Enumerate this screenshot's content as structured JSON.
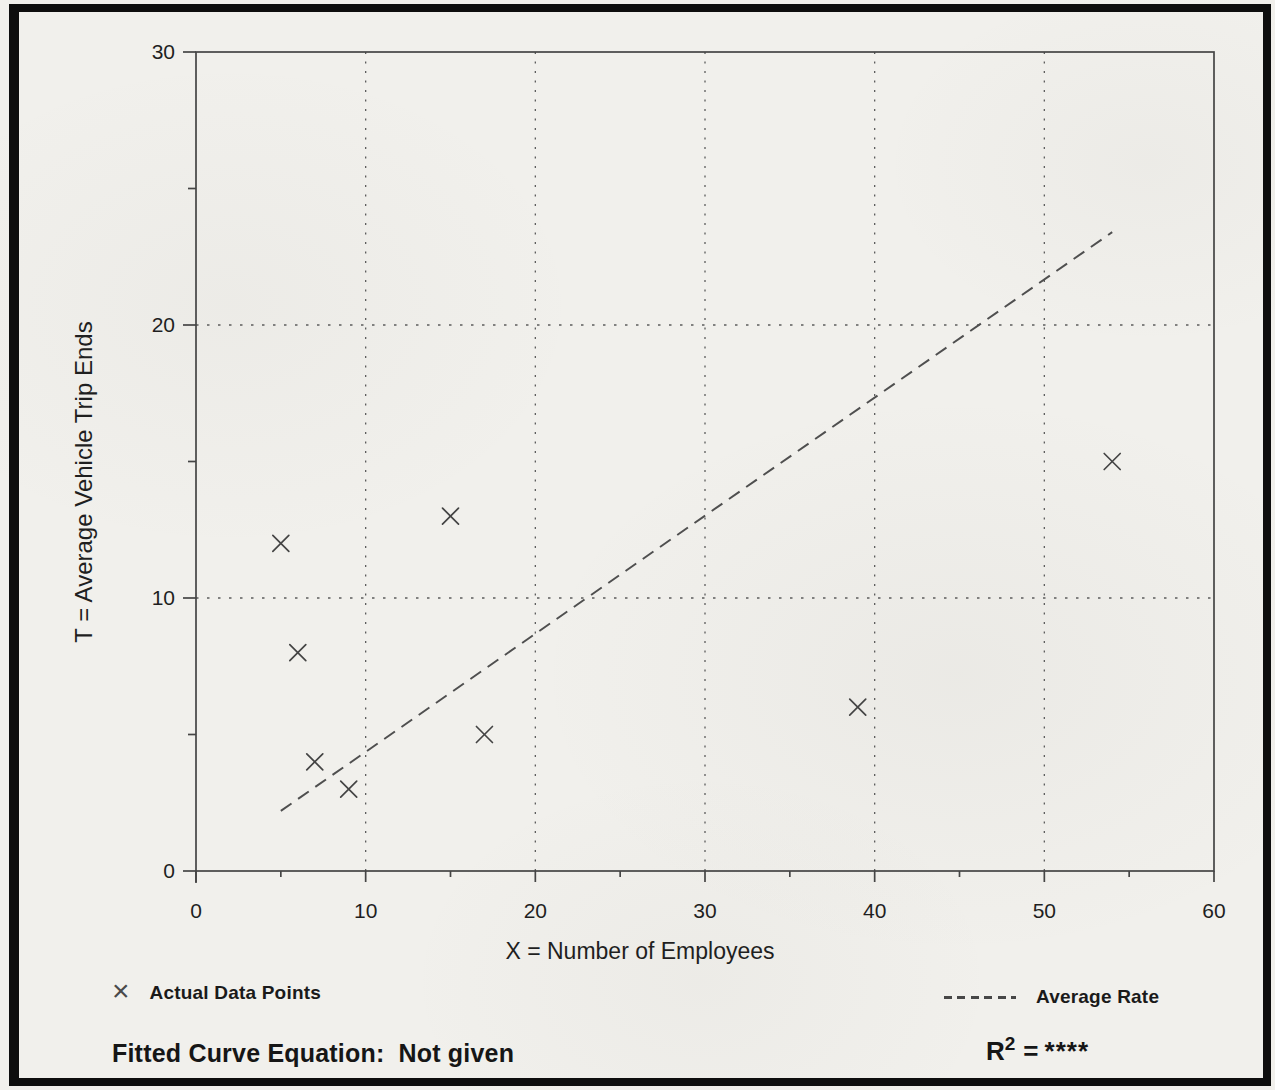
{
  "chart_data": {
    "type": "scatter",
    "title": "",
    "xlabel": "X = Number of Employees",
    "ylabel": "T = Average Vehicle Trip Ends",
    "xlim": [
      0,
      60
    ],
    "ylim": [
      0,
      30
    ],
    "x_major_ticks": [
      0,
      10,
      20,
      30,
      40,
      50,
      60
    ],
    "x_minor_ticks": [
      5,
      15,
      25,
      35,
      45,
      55
    ],
    "y_major_ticks": [
      0,
      10,
      20,
      30
    ],
    "y_minor_ticks": [
      5,
      15,
      25
    ],
    "grid": {
      "show": true,
      "style": "dotted",
      "x_lines": [
        10,
        20,
        30,
        40,
        50
      ],
      "y_lines": [
        10,
        20
      ]
    },
    "legend_position": "below",
    "series": [
      {
        "name": "Actual Data Points",
        "type": "scatter",
        "marker": "x",
        "points": [
          {
            "x": 5,
            "y": 12
          },
          {
            "x": 6,
            "y": 8
          },
          {
            "x": 7,
            "y": 4
          },
          {
            "x": 9,
            "y": 3
          },
          {
            "x": 15,
            "y": 13
          },
          {
            "x": 17,
            "y": 5
          },
          {
            "x": 39,
            "y": 6
          },
          {
            "x": 54,
            "y": 15
          }
        ]
      },
      {
        "name": "Average Rate",
        "type": "line",
        "style": "dashed",
        "slope": 0.43,
        "points": [
          {
            "x": 5,
            "y": 2.2
          },
          {
            "x": 54,
            "y": 23.4
          }
        ]
      }
    ]
  },
  "axes": {
    "x_title": "X = Number of Employees",
    "y_title": "T = Average Vehicle Trip Ends"
  },
  "legend": {
    "points_marker": "×",
    "points_label": "Actual Data Points",
    "line_label": "Average Rate"
  },
  "footer": {
    "fitted_curve_label": "Fitted Curve Equation:",
    "fitted_curve_value": "Not given",
    "r_squared_base": "R",
    "r_squared_exponent": "2",
    "r_squared_equals": "=",
    "r_squared_value": "****"
  },
  "colors": {
    "background": "#f1f0ec",
    "ink": "#1f1f1f",
    "plot_lines": "#4a4a4a",
    "page_border": "#0e0e0e"
  }
}
